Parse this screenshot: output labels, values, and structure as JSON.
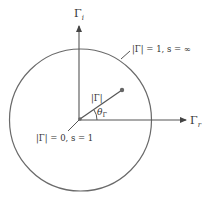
{
  "diagram": {
    "axes": {
      "imag_label_main": "Γ",
      "imag_label_sub": "i",
      "real_label_main": "Γ",
      "real_label_sub": "r"
    },
    "circle_label": "|Γ| = 1, s = ∞",
    "origin_label": "|Γ| = 0, s = 1",
    "vector_label": "|Γ|",
    "angle_label_main": "θ",
    "angle_label_sub": "Γ",
    "colors": {
      "stroke": "#555555",
      "point": "#666666",
      "text": "#333333"
    }
  }
}
